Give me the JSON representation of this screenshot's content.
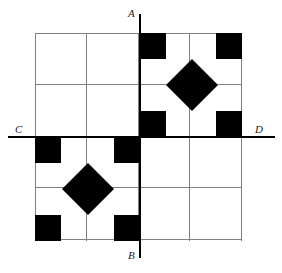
{
  "figure": {
    "labels": {
      "top": "A",
      "bottom": "B",
      "left": "C",
      "right": "D"
    },
    "colors": {
      "shape_fill": "#000000",
      "grid_line": "#808080",
      "axis_line": "#000000",
      "background": "#ffffff",
      "label_text": "#1a1a1a"
    },
    "grid": {
      "columns": 4,
      "rows": 4,
      "left": 35,
      "top": 33,
      "right": 241,
      "bottom": 241,
      "cell_size": 51.5,
      "line_width": 1
    },
    "axes": {
      "vertical": {
        "name": "AB",
        "x": 140,
        "y_start": 14,
        "y_end": 258,
        "top_label": "A",
        "bottom_label": "B"
      },
      "horizontal": {
        "name": "CD",
        "y": 137,
        "x_start": 8,
        "x_end": 275,
        "left_label": "C",
        "right_label": "D"
      }
    },
    "squares": [
      {
        "name": "square-top-center-left",
        "x": 140,
        "y": 33,
        "size": 26
      },
      {
        "name": "square-top-right",
        "x": 216,
        "y": 33,
        "size": 26
      },
      {
        "name": "square-mid-center",
        "x": 140,
        "y": 111,
        "size": 26
      },
      {
        "name": "square-mid-right",
        "x": 216,
        "y": 111,
        "size": 26
      },
      {
        "name": "square-left-upper",
        "x": 35,
        "y": 137,
        "size": 26
      },
      {
        "name": "square-center-left",
        "x": 114,
        "y": 137,
        "size": 26
      },
      {
        "name": "square-bottom-left",
        "x": 35,
        "y": 215,
        "size": 26
      },
      {
        "name": "square-bottom-center",
        "x": 114,
        "y": 215,
        "size": 26
      }
    ],
    "diamonds": [
      {
        "name": "diamond-upper-right",
        "cx": 192,
        "cy": 85,
        "radius": 26
      },
      {
        "name": "diamond-lower-left",
        "cx": 88,
        "cy": 189,
        "radius": 26
      }
    ]
  }
}
